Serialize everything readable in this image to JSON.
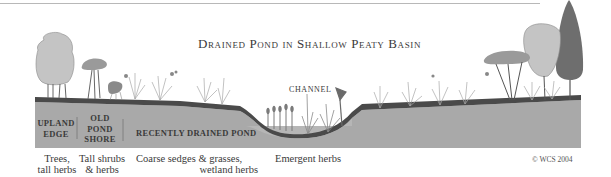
{
  "title": "Drained Pond in Shallow Peaty Basin",
  "labels": {
    "channel": "CHANNEL",
    "zones": [
      {
        "id": "upland-edge",
        "lines": [
          "UPLAND",
          "EDGE"
        ]
      },
      {
        "id": "old-pond-shore",
        "lines": [
          "OLD",
          "POND",
          "SHORE"
        ]
      },
      {
        "id": "recently-drained-pond",
        "lines": [
          "RECENTLY DRAINED POND"
        ]
      }
    ],
    "captions": [
      {
        "id": "trees",
        "lines": [
          "Trees,",
          "tall herbs"
        ]
      },
      {
        "id": "shrubs",
        "lines": [
          "Tall shrubs",
          "& herbs"
        ]
      },
      {
        "id": "sedges",
        "lines": [
          "Coarse sedges & grasses,",
          "wetland herbs"
        ]
      },
      {
        "id": "emergent",
        "lines": [
          "Emergent herbs"
        ]
      }
    ],
    "copyright": "© WCS 2004"
  },
  "colors": {
    "ground": "#a9a9a9",
    "topsoil": "#4a4a4a",
    "tree_light": "#c4c4c4",
    "tree_mid": "#9a9a9a",
    "tree_dark": "#6e6e6e",
    "plant": "#9c9c9c"
  }
}
